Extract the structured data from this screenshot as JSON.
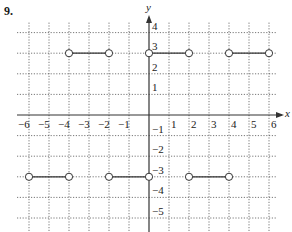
{
  "problem": {
    "number": "9."
  },
  "chart_data": {
    "type": "line",
    "title": "",
    "xlabel": "x",
    "ylabel": "y",
    "xlim": [
      -6,
      6
    ],
    "ylim": [
      -5,
      4
    ],
    "grid": true,
    "grid_style": "dotted",
    "x_ticks": [
      -6,
      -5,
      -4,
      -3,
      -2,
      -1,
      1,
      2,
      3,
      4,
      5,
      6
    ],
    "y_ticks": [
      -5,
      -4,
      -3,
      -2,
      -1,
      1,
      2,
      3,
      4
    ],
    "x_tick_labels": [
      "−6",
      "−5",
      "−4",
      "−3",
      "−2",
      "−1",
      "1",
      "2",
      "3",
      "4",
      "5",
      "6"
    ],
    "y_tick_labels": [
      "−5",
      "−4",
      "−3",
      "−2",
      "−1",
      "1",
      "2",
      "3",
      "4"
    ],
    "series": [
      {
        "name": "segments",
        "segments": [
          {
            "x": [
              -4,
              -2
            ],
            "y": 3,
            "left_endpoint": "open",
            "right_endpoint": "open"
          },
          {
            "x": [
              0,
              2
            ],
            "y": 3,
            "left_endpoint": "open",
            "right_endpoint": "open"
          },
          {
            "x": [
              4,
              6
            ],
            "y": 3,
            "left_endpoint": "open",
            "right_endpoint": "open"
          },
          {
            "x": [
              -6,
              -4
            ],
            "y": -3,
            "left_endpoint": "open",
            "right_endpoint": "open"
          },
          {
            "x": [
              -2,
              0
            ],
            "y": -3,
            "left_endpoint": "open",
            "right_endpoint": "open"
          },
          {
            "x": [
              2,
              4
            ],
            "y": -3,
            "left_endpoint": "open",
            "right_endpoint": "open"
          }
        ]
      }
    ]
  },
  "colors": {
    "axis": "#333333",
    "grid": "#555555",
    "segment": "#333333"
  }
}
